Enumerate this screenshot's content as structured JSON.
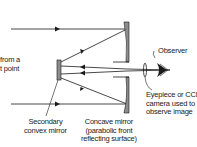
{
  "diagram": {
    "type": "Cassegrain reflecting telescope schematic",
    "labels": {
      "light_source_line1": "from a",
      "light_source_line2": "t point",
      "secondary_line1": "Secondary",
      "secondary_line2": "convex mirror",
      "primary_line1": "Concave mirror",
      "primary_line2": "(parabolic front",
      "primary_line3": "reflecting surface)",
      "observer": "Observer",
      "eyepiece_line1": "Eyepiece or CCD",
      "eyepiece_line2": "camera used to",
      "eyepiece_line3": "observe image"
    },
    "colors": {
      "line": "#1a1a1a",
      "mirror_fill": "#8c8c8c",
      "text": "#222222"
    }
  }
}
